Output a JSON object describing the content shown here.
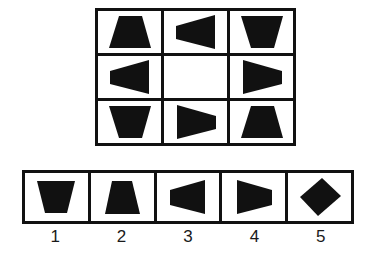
{
  "puzzle": {
    "kind": "matrix-reasoning",
    "title": "Figure Matrix Puzzle",
    "ink_color": "#111111",
    "background_color": "#ffffff",
    "missing_cell_index": 4
  },
  "matrix": {
    "rows": 3,
    "columns": 3,
    "cells": [
      {
        "position": "row1-col1",
        "shape": "trapezoid",
        "orientation": "up",
        "label": "trapezoid pointing up",
        "empty": false
      },
      {
        "position": "row1-col2",
        "shape": "trapezoid",
        "orientation": "left",
        "label": "trapezoid pointing left",
        "empty": false
      },
      {
        "position": "row1-col3",
        "shape": "trapezoid",
        "orientation": "down",
        "label": "trapezoid pointing down",
        "empty": false
      },
      {
        "position": "row2-col1",
        "shape": "trapezoid",
        "orientation": "left",
        "label": "trapezoid pointing left",
        "empty": false
      },
      {
        "position": "row2-col2",
        "shape": "none",
        "orientation": "none",
        "label": "empty cell (missing piece)",
        "empty": true
      },
      {
        "position": "row2-col3",
        "shape": "trapezoid",
        "orientation": "right",
        "label": "trapezoid pointing right",
        "empty": false
      },
      {
        "position": "row3-col1",
        "shape": "trapezoid",
        "orientation": "down",
        "label": "trapezoid pointing down",
        "empty": false
      },
      {
        "position": "row3-col2",
        "shape": "trapezoid",
        "orientation": "right",
        "label": "trapezoid pointing right",
        "empty": false
      },
      {
        "position": "row3-col3",
        "shape": "trapezoid",
        "orientation": "up",
        "label": "trapezoid pointing up",
        "empty": false
      }
    ]
  },
  "options": {
    "count": 5,
    "items": [
      {
        "number": "1",
        "shape": "trapezoid",
        "orientation": "down",
        "label": "trapezoid pointing down"
      },
      {
        "number": "2",
        "shape": "trapezoid",
        "orientation": "up",
        "label": "trapezoid pointing up"
      },
      {
        "number": "3",
        "shape": "trapezoid",
        "orientation": "left",
        "label": "trapezoid pointing left"
      },
      {
        "number": "4",
        "shape": "trapezoid",
        "orientation": "right",
        "label": "trapezoid pointing right"
      },
      {
        "number": "5",
        "shape": "diamond",
        "orientation": "none",
        "label": "diamond / rhombus"
      }
    ]
  }
}
